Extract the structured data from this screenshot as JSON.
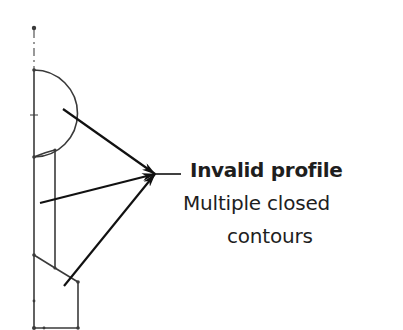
{
  "annotation": {
    "title": "Invalid profile",
    "line2": "Multiple closed",
    "line3": "contours"
  },
  "colors": {
    "stroke": "#3a3a3a",
    "arrow": "#111111",
    "text": "#1e1e1e"
  }
}
